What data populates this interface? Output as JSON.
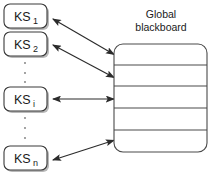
{
  "diagram": {
    "background_color": "#ffffff",
    "line_color": "#2b2b2b",
    "shadow_color": "#b9b9b9",
    "knowledge_sources": [
      {
        "id": "ks1",
        "base": "KS",
        "subscript": "1"
      },
      {
        "id": "ks2",
        "base": "KS",
        "subscript": "2"
      },
      {
        "id": "ksi",
        "base": "KS",
        "subscript": "i"
      },
      {
        "id": "ksn",
        "base": "KS",
        "subscript": "n"
      }
    ],
    "ellipsis_groups": [
      {
        "id": "ellipsis-upper",
        "dots": 3
      },
      {
        "id": "ellipsis-lower",
        "dots": 3
      }
    ],
    "blackboard": {
      "label_line1": "Global",
      "label_line2": "blackboard",
      "panel_count": 5,
      "panels": [
        "",
        "",
        "",
        "",
        ""
      ]
    },
    "connectors": [
      {
        "id": "connector-ks1",
        "from": "ks1",
        "to": "blackboard",
        "style": "double-arrow"
      },
      {
        "id": "connector-ks2",
        "from": "ks2",
        "to": "blackboard",
        "style": "double-arrow"
      },
      {
        "id": "connector-ksi",
        "from": "ksi",
        "to": "blackboard",
        "style": "double-arrow"
      },
      {
        "id": "connector-ksn",
        "from": "ksn",
        "to": "blackboard",
        "style": "double-arrow"
      }
    ]
  }
}
